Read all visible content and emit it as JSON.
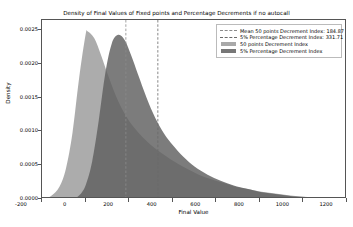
{
  "chart_data": {
    "type": "area",
    "title": "Density of Final Values of Fixed points and Percentage Decrements if no autocall",
    "xlabel": "Final Value",
    "ylabel": "Density",
    "xlim": [
      -200,
      1200
    ],
    "ylim": [
      0.0,
      0.00265
    ],
    "grid": false,
    "legend_position": "upper right",
    "xticks": [
      -200,
      0,
      200,
      400,
      600,
      800,
      1000,
      1200
    ],
    "xtick_labels": [
      "-200",
      "0",
      "200",
      "400",
      "600",
      "800",
      "1000",
      "1200"
    ],
    "yticks": [
      0.0,
      0.0005,
      0.001,
      0.0015,
      0.002,
      0.0025
    ],
    "ytick_labels": [
      "0.0000",
      "0.0005",
      "0.0010",
      "0.0015",
      "0.0020",
      "0.0025"
    ],
    "series": [
      {
        "name": "50 points Decrement Index",
        "kind": "density-fill",
        "color": "#9a9a9a",
        "peak_x": 10,
        "peak_y": 0.00248,
        "x": [
          -200,
          -160,
          -120,
          -90,
          -60,
          -30,
          0,
          10,
          40,
          70,
          100,
          140,
          180,
          220,
          260,
          300,
          340,
          380,
          420,
          470,
          520,
          570,
          620,
          680,
          740,
          800,
          870,
          940,
          1010,
          1080,
          1140,
          1200
        ],
        "y": [
          0.0,
          4e-05,
          0.00018,
          0.00045,
          0.00098,
          0.00178,
          0.00243,
          0.00248,
          0.00238,
          0.00214,
          0.00186,
          0.00152,
          0.00126,
          0.00107,
          0.00092,
          0.0008,
          0.0007,
          0.00061,
          0.00053,
          0.00044,
          0.00036,
          0.0003,
          0.00025,
          0.00019,
          0.00015,
          0.00011,
          8e-05,
          5e-05,
          3e-05,
          2e-05,
          1e-05,
          0.0
        ]
      },
      {
        "name": "5% Percentage Decrement Index",
        "kind": "density-fill",
        "color": "#5f5f5f",
        "peak_x": 150,
        "peak_y": 0.00243,
        "x": [
          -60,
          -30,
          0,
          30,
          60,
          90,
          120,
          150,
          180,
          210,
          240,
          280,
          320,
          360,
          400,
          450,
          500,
          560,
          620,
          680,
          740,
          810,
          880,
          950,
          1020,
          1090,
          1150,
          1200
        ],
        "y": [
          0.0,
          5e-05,
          0.0002,
          0.00055,
          0.00115,
          0.00185,
          0.0023,
          0.00243,
          0.00235,
          0.00212,
          0.00185,
          0.0015,
          0.0012,
          0.00097,
          0.0008,
          0.00062,
          0.00048,
          0.00036,
          0.00027,
          0.0002,
          0.00015,
          0.0001,
          7e-05,
          4e-05,
          3e-05,
          2e-05,
          1e-05,
          0.0
        ]
      }
    ],
    "vlines": [
      {
        "name": "Mean 50 points Decrement Index",
        "x": 184.87,
        "label": "184.87",
        "color": "#8a8a8a",
        "style": "dashed"
      },
      {
        "name": "Mean 5% Percentage Decrement Index",
        "x": 331.71,
        "label": "331.71",
        "color": "#6a6a6a",
        "style": "dashed"
      }
    ],
    "legend": [
      {
        "label": "Mean 50 points Decrement Index: 184.87",
        "marker": "dashed-line",
        "color": "#8a8a8a"
      },
      {
        "label": "5% Percentage Decrement Index: 331.71",
        "marker": "dashed-line",
        "color": "#6a6a6a"
      },
      {
        "label": "50 points Decrement Index",
        "marker": "patch",
        "color": "#9a9a9a"
      },
      {
        "label": "5% Percentage Decrement Index",
        "marker": "patch",
        "color": "#5f5f5f"
      }
    ]
  }
}
